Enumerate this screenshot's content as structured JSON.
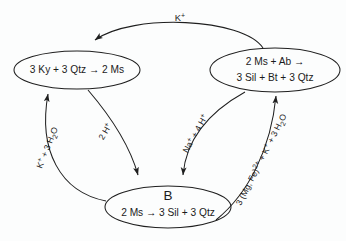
{
  "diagram": {
    "title_label": "K+",
    "background_color": "#fcfdfd",
    "stroke_color": "#1f1f1f",
    "nodes": [
      {
        "id": "ky-qtz-ms",
        "name": "left-node",
        "lines": [
          "3 Ky + 3 Qtz → 2 Ms"
        ],
        "cx": 77,
        "cy": 70,
        "rx": 63,
        "ry": 19
      },
      {
        "id": "ms-ab-sil-bt-qtz",
        "name": "right-node",
        "lines": [
          "2 Ms + Ab →",
          "3 Sil + Bt + 3 Qtz"
        ],
        "cx": 275,
        "cy": 70,
        "rx": 65,
        "ry": 22
      },
      {
        "id": "b-node",
        "name": "bottom-node",
        "label": "B",
        "lines": [
          "2 Ms → 3 Sil + 3 Qtz"
        ],
        "cx": 168,
        "cy": 207,
        "rx": 63,
        "ry": 21
      }
    ],
    "edges": [
      {
        "id": "k-top",
        "name": "edge-k-plus",
        "label": "K",
        "superscript": "+",
        "from": "right-node",
        "to": "left-node"
      },
      {
        "id": "k-3h2o",
        "name": "edge-k-3h2o",
        "label_parts": [
          "K",
          "+",
          " + 3 H",
          "2",
          "O"
        ],
        "label_plain": "K+ + 3 H2O",
        "from": "bottom-node",
        "to": "left-node"
      },
      {
        "id": "2h",
        "name": "edge-2h-plus",
        "label_plain": "2 H+",
        "from": "left-node",
        "to": "bottom-node"
      },
      {
        "id": "na-4h",
        "name": "edge-na-4h",
        "label_plain": "Na+ + 4 H+",
        "from": "right-node",
        "to": "bottom-node"
      },
      {
        "id": "mgfe-k-3h2o",
        "name": "edge-mgfe-k-3h2o",
        "label_plain": "3 (Mg, Fe)2+ + K+ + 3 H2O",
        "from": "bottom-node",
        "to": "right-node"
      }
    ]
  }
}
